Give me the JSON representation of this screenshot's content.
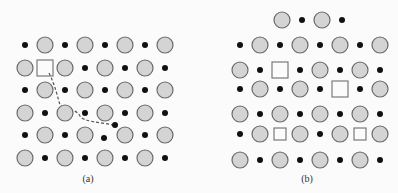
{
  "figure": {
    "panels": [
      {
        "label": "(a)",
        "label_pos": [
          88,
          181
        ],
        "description": "Ionic lattice with one vacancy; dashed path shows an interstitial migration",
        "rows": [
          {
            "y": 45,
            "items": [
              "dot",
              "C",
              "dot",
              "C",
              "dot",
              "C",
              "dot",
              "C"
            ]
          },
          {
            "y": 68,
            "items": [
              "C",
              "Sq",
              "C",
              "dot",
              "C",
              "dot",
              "C",
              "dot"
            ]
          },
          {
            "y": 90,
            "items": [
              "dot",
              "C",
              "dot",
              "C",
              "dot",
              "C",
              "dot",
              "C"
            ]
          },
          {
            "y": 113,
            "items": [
              "C",
              "dot",
              "C",
              "dot",
              "C",
              "dot",
              "C",
              "dot"
            ]
          },
          {
            "y": 135,
            "items": [
              "dot",
              "C",
              "dot",
              "C",
              "none",
              "C",
              "dot",
              "C"
            ]
          },
          {
            "y": 158,
            "items": [
              "C",
              "dot",
              "C",
              "dot",
              "C",
              "dot",
              "C",
              "dot"
            ]
          }
        ],
        "x_start": 25,
        "x_step": 20,
        "extra_dots": [
          [
            104,
            138
          ],
          [
            115,
            125
          ]
        ],
        "path": "M 49 73 C 55 85, 57 95, 60 105 C 64 110, 76 108, 80 116 C 84 122, 100 122, 113 125"
      },
      {
        "label": "(b)",
        "label_pos": [
          307,
          181
        ],
        "description": "Ionic lattice with paired vacancies (Schottky defects)",
        "rows": [
          {
            "y": 20,
            "x_start": 282,
            "items": [
              "C",
              "dot",
              "C",
              "dot"
            ]
          },
          {
            "y": 45,
            "x_start": 240,
            "items": [
              "dot",
              "C",
              "dot",
              "C",
              "dot",
              "C",
              "dot",
              "C"
            ]
          },
          {
            "y": 70,
            "x_start": 240,
            "items": [
              "C",
              "dot",
              "Sq",
              "dot",
              "C",
              "dot",
              "C",
              "dot"
            ]
          },
          {
            "y": 89,
            "x_start": 240,
            "items": [
              "dot",
              "C",
              "dot",
              "C",
              "dot",
              "Sq",
              "dot",
              "C"
            ]
          },
          {
            "y": 114,
            "x_start": 240,
            "items": [
              "C",
              "dot",
              "C",
              "dot",
              "C",
              "dot",
              "C",
              "dot"
            ]
          },
          {
            "y": 134,
            "x_start": 240,
            "items": [
              "dot",
              "C",
              "sq",
              "C",
              "dot",
              "C",
              "sq",
              "C"
            ]
          },
          {
            "y": 160,
            "x_start": 240,
            "items": [
              "C",
              "dot",
              "C",
              "dot",
              "C",
              "dot",
              "C",
              "dot"
            ]
          }
        ],
        "x_step": 20
      }
    ],
    "colors": {
      "circle_fill": "#d4d4d4",
      "circle_stroke": "#6a6a6a",
      "dot": "#111111",
      "square_stroke": "#7a7a7a",
      "path": "#555555"
    }
  }
}
